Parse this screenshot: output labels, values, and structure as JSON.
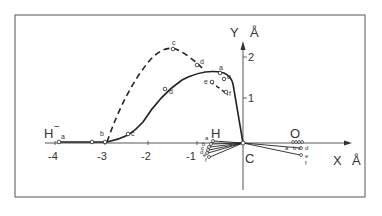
{
  "diagram": {
    "frame": {
      "x": 15,
      "y": 15,
      "w": 350,
      "h": 182
    },
    "origin_px": {
      "x": 243,
      "y": 143
    },
    "scale_px": {
      "x": 48.5,
      "y": 41
    },
    "axes": {
      "x_label": "X",
      "x_unit": "Å",
      "y_label": "Y",
      "y_unit": "Å",
      "x_ticks": [
        {
          "value": -4,
          "label": "-4"
        },
        {
          "value": -3,
          "label": "-3"
        },
        {
          "value": -2,
          "label": "-2"
        },
        {
          "value": -1,
          "label": "-1"
        }
      ],
      "y_ticks": [
        {
          "value": 1,
          "label": "1"
        },
        {
          "value": 2,
          "label": "2"
        }
      ]
    },
    "atom_labels": {
      "hydride": "H",
      "hydride_charge": "−",
      "hydrogen": "H",
      "carbon": "C",
      "oxygen": "O"
    },
    "solid_path_labels": [
      "a",
      "b",
      "c",
      "d",
      "e",
      "f"
    ],
    "dashed_path_labels": [
      "b",
      "c",
      "d",
      "e",
      "f"
    ],
    "h_labels": [
      "a",
      "b",
      "c",
      "d",
      "e",
      "f"
    ],
    "o_labels": [
      "a",
      "b",
      "c",
      "d",
      "e",
      "f"
    ],
    "colors": {
      "ink": "#333333",
      "background": "#ffffff",
      "frame": "#555555"
    }
  }
}
